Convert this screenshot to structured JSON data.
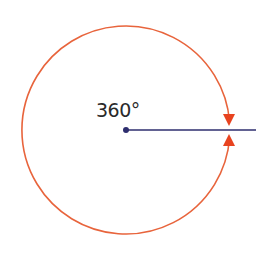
{
  "diagram": {
    "angle_label": "360°",
    "center": {
      "x": 126,
      "y": 130
    },
    "radius": 104,
    "ray_end_x": 256,
    "colors": {
      "circle": "#e8643c",
      "arrowhead": "#e8431f",
      "ray": "#2e2e6e",
      "vertex": "#2e2e6e",
      "background": "#ffffff"
    }
  }
}
